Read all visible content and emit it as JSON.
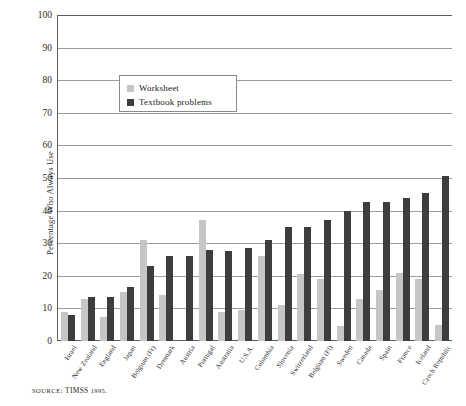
{
  "chart_data": {
    "type": "bar",
    "title": "",
    "xlabel": "",
    "ylabel": "Percentage Who Always Use",
    "ylim": [
      0,
      100
    ],
    "ytick_step": 10,
    "yticks": [
      100,
      90,
      80,
      70,
      60,
      50,
      40,
      30,
      20,
      10,
      0
    ],
    "grid": "horizontal",
    "legend_position": "upper-left-inside",
    "categories": [
      "Israel",
      "New Zealand",
      "England",
      "Japan",
      "Belgium (Fr)",
      "Denmark",
      "Austria",
      "Portugal",
      "Australia",
      "U.S.A.",
      "Colombia",
      "Slovenia",
      "Switzerland",
      "Belgium (Fl)",
      "Sweden",
      "Canada",
      "Spain",
      "France",
      "Iceland",
      "Czech Republic"
    ],
    "series": [
      {
        "name": "Worksheet",
        "color": "#c6c6c6",
        "values": [
          9,
          13,
          7.5,
          15,
          31,
          14,
          0,
          37,
          9,
          9.5,
          26,
          11,
          20.5,
          19,
          4.5,
          13,
          15.5,
          21,
          19,
          5
        ]
      },
      {
        "name": "Textbook problems",
        "color": "#3d3d3d",
        "values": [
          8,
          13.5,
          13.5,
          16.5,
          23,
          26,
          26,
          28,
          27.5,
          28.5,
          31,
          35,
          35,
          37,
          40,
          42.5,
          42.5,
          44,
          45.5,
          50.5
        ]
      }
    ]
  },
  "legend": {
    "items": [
      {
        "label": "Worksheet",
        "color": "#c6c6c6"
      },
      {
        "label": "Textbook problems",
        "color": "#3d3d3d"
      }
    ]
  },
  "source": {
    "prefix": "SOURCE:",
    "name": "TIMSS",
    "year": "1995."
  },
  "colors": {
    "light_bar": "#c6c6c6",
    "dark_bar": "#3d3d3d",
    "gridline": "#9a9a9a",
    "axis": "#5d5d5d",
    "text": "#2b2b2b"
  }
}
